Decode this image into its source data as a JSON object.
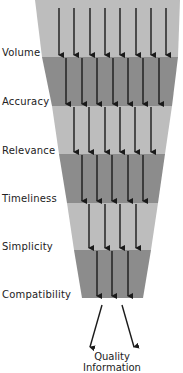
{
  "diagram": {
    "type": "funnel",
    "colors": {
      "light_band": "#bdbdbd",
      "dark_band": "#8c8c8c",
      "arrow": "#1a1a1a",
      "text": "#222222"
    },
    "stages": [
      {
        "label": "Volume",
        "arrows": 8,
        "shade": "light",
        "y_top": 0,
        "y_bot": 57,
        "top_left": 35,
        "top_right": 180,
        "bot_left": 42,
        "bot_right": 178,
        "arrow_x": [
          59,
          74,
          90,
          105,
          120,
          136,
          151,
          166
        ]
      },
      {
        "label": "Accuracy",
        "arrows": 7,
        "shade": "dark",
        "y_top": 57,
        "y_bot": 106,
        "top_left": 42,
        "top_right": 178,
        "bot_left": 52,
        "bot_right": 172,
        "arrow_x": [
          66,
          82,
          97,
          113,
          128,
          143,
          159
        ]
      },
      {
        "label": "Relevance",
        "arrows": 6,
        "shade": "light",
        "y_top": 106,
        "y_bot": 154,
        "top_left": 52,
        "top_right": 172,
        "bot_left": 59,
        "bot_right": 165,
        "arrow_x": [
          74,
          89,
          105,
          120,
          135,
          151
        ]
      },
      {
        "label": "Timeliness",
        "arrows": 5,
        "shade": "dark",
        "y_top": 154,
        "y_bot": 203,
        "top_left": 59,
        "top_right": 165,
        "bot_left": 67,
        "bot_right": 158,
        "arrow_x": [
          82,
          97,
          112,
          128,
          143
        ]
      },
      {
        "label": "Simplicity",
        "arrows": 4,
        "shade": "light",
        "y_top": 203,
        "y_bot": 250,
        "top_left": 67,
        "top_right": 158,
        "bot_left": 74,
        "bot_right": 151,
        "arrow_x": [
          89,
          105,
          120,
          136
        ]
      },
      {
        "label": "Compatibility",
        "arrows": 3,
        "shade": "dark",
        "y_top": 250,
        "y_bot": 298,
        "top_left": 74,
        "top_right": 151,
        "bot_left": 82,
        "bot_right": 143,
        "arrow_x": [
          97,
          112,
          128
        ]
      }
    ],
    "output": {
      "line1": "Quality",
      "line2": "Information",
      "arrows": [
        {
          "x1": 102,
          "y1": 305,
          "x2": 90,
          "y2": 347
        },
        {
          "x1": 122,
          "y1": 305,
          "x2": 134,
          "y2": 347
        }
      ]
    }
  }
}
